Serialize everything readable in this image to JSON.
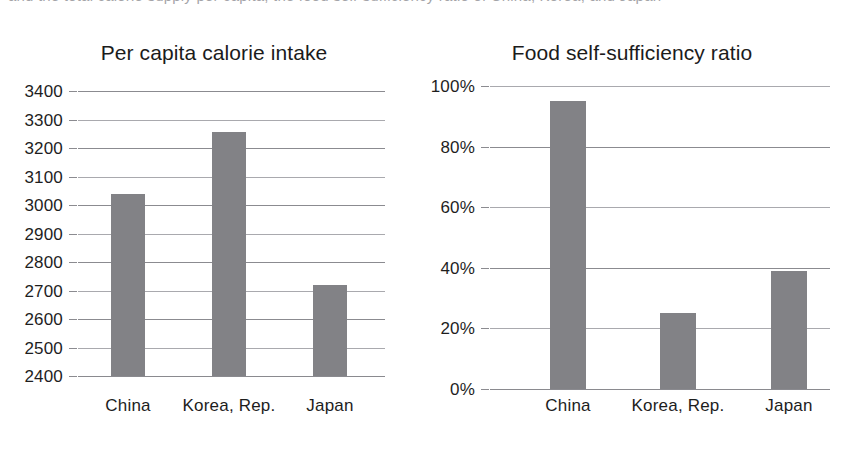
{
  "page": {
    "clipped_top_text": "and the total calorie supply per capita, the food self-sufficiency ratio of China, Korea, and Japan"
  },
  "colors": {
    "bar_fill": "#828286",
    "gridline": "#8b8b90",
    "text": "#1d1d1d",
    "background": "#ffffff"
  },
  "chart_data": [
    {
      "type": "bar",
      "title": "Per capita calorie intake",
      "xlabel": "",
      "ylabel": "",
      "categories": [
        "China",
        "Korea, Rep.",
        "Japan"
      ],
      "values": [
        3040,
        3255,
        2720
      ],
      "ylim": [
        2400,
        3400
      ],
      "yticks": [
        2400,
        2500,
        2600,
        2700,
        2800,
        2900,
        3000,
        3100,
        3200,
        3300,
        3400
      ],
      "ytick_labels": [
        "2400",
        "2500",
        "2600",
        "2700",
        "2800",
        "2900",
        "3000",
        "3100",
        "3200",
        "3300",
        "3400"
      ],
      "grid": true,
      "legend": "none",
      "bar_color": "#828286"
    },
    {
      "type": "bar",
      "title": "Food self-sufficiency ratio",
      "xlabel": "",
      "ylabel": "",
      "categories": [
        "China",
        "Korea, Rep.",
        "Japan"
      ],
      "values": [
        95,
        25,
        39
      ],
      "ylim": [
        0,
        100
      ],
      "yticks": [
        0,
        20,
        40,
        60,
        80,
        100
      ],
      "ytick_labels": [
        "0%",
        "20%",
        "40%",
        "60%",
        "80%",
        "100%"
      ],
      "grid": true,
      "legend": "none",
      "bar_color": "#828286"
    }
  ]
}
